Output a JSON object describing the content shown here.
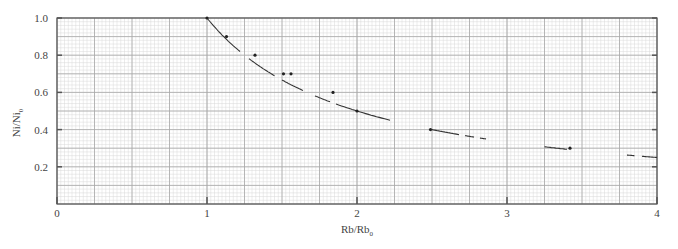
{
  "chart_data": {
    "type": "scatter",
    "title": "",
    "xlabel": "Rb/Rb₀",
    "xlabel_main": "Rb/Rb",
    "xlabel_sub": "0",
    "ylabel": "Ni/Ni₀",
    "ylabel_main": "Ni/Ni",
    "ylabel_sub": "0",
    "xlim": [
      0,
      4
    ],
    "ylim": [
      0,
      1.0
    ],
    "x_ticks": [
      0,
      1,
      2,
      3,
      4
    ],
    "x_tick_labels": [
      "0",
      "1",
      "2",
      "3",
      "4"
    ],
    "y_ticks": [
      0.2,
      0.4,
      0.6,
      0.8,
      1.0
    ],
    "y_tick_labels": [
      "0.2",
      "0.4",
      "0.6",
      "0.8",
      "1.0"
    ],
    "grid": true,
    "grid_style": "graph paper (major 0.25 x, 0.1 y; fine minor subdivisions)",
    "legend": null,
    "series": [
      {
        "name": "measured points",
        "type": "scatter",
        "x": [
          1.0,
          1.13,
          1.32,
          1.51,
          1.56,
          1.84,
          2.0,
          2.49,
          3.42
        ],
        "y": [
          1.0,
          0.9,
          0.8,
          0.7,
          0.7,
          0.6,
          0.5,
          0.4,
          0.3
        ]
      },
      {
        "name": "theoretical curve (1/x)",
        "type": "line",
        "style": "dashed / broken segments",
        "x": [
          1.0,
          1.1,
          1.2,
          1.3,
          1.4,
          1.5,
          1.6,
          1.7,
          1.8,
          1.9,
          2.0,
          2.1,
          2.2,
          2.5,
          2.6,
          2.8,
          3.3,
          3.4,
          3.8,
          4.0
        ],
        "y": [
          1.0,
          0.909,
          0.833,
          0.769,
          0.714,
          0.667,
          0.625,
          0.588,
          0.556,
          0.526,
          0.5,
          0.476,
          0.455,
          0.4,
          0.385,
          0.357,
          0.303,
          0.294,
          0.263,
          0.25
        ]
      }
    ]
  },
  "colors": {
    "background": "#ffffff",
    "minor_grid": "#d9d9d9",
    "major_grid": "#a8a8a8",
    "axis": "#555555",
    "curve": "#333333",
    "points": "#222222"
  }
}
